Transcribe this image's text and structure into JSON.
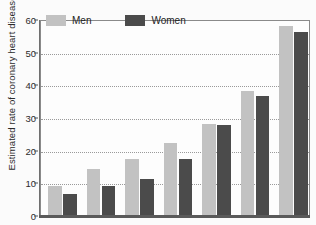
{
  "chart_data": {
    "type": "bar",
    "title": "",
    "xlabel": "",
    "ylabel": "Estimated rate of coronary heart disease  (percentage)",
    "ylim": [
      0,
      60
    ],
    "yticks": [
      0,
      10,
      20,
      30,
      40,
      50,
      60
    ],
    "ytick_labels": [
      "0",
      "10",
      "20",
      "30",
      "40",
      "50",
      "60"
    ],
    "grid": true,
    "grid_style": "dotted",
    "legend_position": "top-left",
    "categories": [
      "1",
      "2",
      "3",
      "4",
      "5",
      "6",
      "7"
    ],
    "xtick_labels": [],
    "series": [
      {
        "name": "Men",
        "color": "#c2c2c2",
        "values": [
          9,
          14,
          17,
          22,
          28,
          38,
          58
        ]
      },
      {
        "name": "Women",
        "color": "#4b4b4b",
        "values": [
          6.5,
          9,
          11,
          17,
          27.5,
          36.5,
          56
        ]
      }
    ]
  },
  "legend": {
    "men_label": "Men",
    "women_label": "Women"
  }
}
